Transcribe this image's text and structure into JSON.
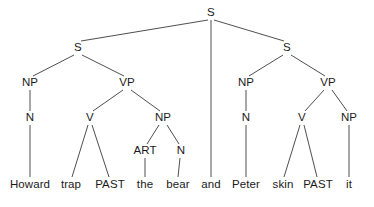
{
  "figure": {
    "type": "syntax-tree",
    "width": 374,
    "height": 207,
    "background_color": "#ffffff",
    "line_color": "#3a3a3a",
    "text_color": "#1a1a1a",
    "sentence": "Howard trap PAST the bear and Peter skin PAST it"
  },
  "nodes": {
    "root_s": {
      "label": "S",
      "x": 211,
      "y": 13
    },
    "left_s": {
      "label": "S",
      "x": 78,
      "y": 48
    },
    "right_s": {
      "label": "S",
      "x": 287,
      "y": 48
    },
    "left_np": {
      "label": "NP",
      "x": 30,
      "y": 83
    },
    "left_vp": {
      "label": "VP",
      "x": 127,
      "y": 83
    },
    "right_np": {
      "label": "NP",
      "x": 246,
      "y": 83
    },
    "right_vp": {
      "label": "VP",
      "x": 328,
      "y": 83
    },
    "left_n": {
      "label": "N",
      "x": 30,
      "y": 118
    },
    "left_v": {
      "label": "V",
      "x": 90,
      "y": 118
    },
    "left_obj_np": {
      "label": "NP",
      "x": 163,
      "y": 118
    },
    "right_n": {
      "label": "N",
      "x": 246,
      "y": 118
    },
    "right_v": {
      "label": "V",
      "x": 302,
      "y": 118
    },
    "right_obj_np": {
      "label": "NP",
      "x": 349,
      "y": 118
    },
    "art": {
      "label": "ART",
      "x": 145,
      "y": 151
    },
    "obj_n": {
      "label": "N",
      "x": 181,
      "y": 151
    }
  },
  "leaves": [
    {
      "id": "leaf-howard",
      "label": "Howard",
      "x": 30,
      "y": 185
    },
    {
      "id": "leaf-trap",
      "label": "trap",
      "x": 71,
      "y": 185
    },
    {
      "id": "leaf-past-1",
      "label": "PAST",
      "x": 110,
      "y": 185
    },
    {
      "id": "leaf-the",
      "label": "the",
      "x": 145,
      "y": 185
    },
    {
      "id": "leaf-bear",
      "label": "bear",
      "x": 178,
      "y": 185
    },
    {
      "id": "leaf-and",
      "label": "and",
      "x": 211,
      "y": 185
    },
    {
      "id": "leaf-peter",
      "label": "Peter",
      "x": 246,
      "y": 185
    },
    {
      "id": "leaf-skin",
      "label": "skin",
      "x": 283,
      "y": 185
    },
    {
      "id": "leaf-past-2",
      "label": "PAST",
      "x": 318,
      "y": 185
    },
    {
      "id": "leaf-it",
      "label": "it",
      "x": 349,
      "y": 185
    }
  ],
  "edges": [
    {
      "from": "root_s",
      "to": "left_s",
      "x1": 208,
      "y1": 20,
      "x2": 81,
      "y2": 41
    },
    {
      "from": "root_s",
      "to": "leaf-and",
      "x1": 211,
      "y1": 20,
      "x2": 211,
      "y2": 177
    },
    {
      "from": "root_s",
      "to": "right_s",
      "x1": 214,
      "y1": 20,
      "x2": 284,
      "y2": 41
    },
    {
      "from": "left_s",
      "to": "left_np",
      "x1": 74,
      "y1": 55,
      "x2": 33,
      "y2": 76
    },
    {
      "from": "left_s",
      "to": "left_vp",
      "x1": 82,
      "y1": 55,
      "x2": 124,
      "y2": 76
    },
    {
      "from": "left_np",
      "to": "left_n",
      "x1": 30,
      "y1": 90,
      "x2": 30,
      "y2": 111
    },
    {
      "from": "left_vp",
      "to": "left_v",
      "x1": 123,
      "y1": 90,
      "x2": 93,
      "y2": 111
    },
    {
      "from": "left_vp",
      "to": "left_obj_np",
      "x1": 131,
      "y1": 90,
      "x2": 160,
      "y2": 111
    },
    {
      "from": "left_n",
      "to": "leaf-howard",
      "x1": 30,
      "y1": 125,
      "x2": 30,
      "y2": 177
    },
    {
      "from": "left_v",
      "to": "leaf-trap",
      "x1": 88,
      "y1": 125,
      "x2": 72,
      "y2": 177
    },
    {
      "from": "left_v",
      "to": "leaf-past-1",
      "x1": 92,
      "y1": 125,
      "x2": 109,
      "y2": 177
    },
    {
      "from": "left_obj_np",
      "to": "art",
      "x1": 159,
      "y1": 125,
      "x2": 147,
      "y2": 144
    },
    {
      "from": "left_obj_np",
      "to": "obj_n",
      "x1": 167,
      "y1": 125,
      "x2": 179,
      "y2": 144
    },
    {
      "from": "art",
      "to": "leaf-the",
      "x1": 145,
      "y1": 158,
      "x2": 145,
      "y2": 177
    },
    {
      "from": "obj_n",
      "to": "leaf-bear",
      "x1": 180,
      "y1": 158,
      "x2": 178,
      "y2": 177
    },
    {
      "from": "right_s",
      "to": "right_np",
      "x1": 283,
      "y1": 55,
      "x2": 249,
      "y2": 76
    },
    {
      "from": "right_s",
      "to": "right_vp",
      "x1": 291,
      "y1": 55,
      "x2": 325,
      "y2": 76
    },
    {
      "from": "right_np",
      "to": "right_n",
      "x1": 246,
      "y1": 90,
      "x2": 246,
      "y2": 111
    },
    {
      "from": "right_vp",
      "to": "right_v",
      "x1": 324,
      "y1": 90,
      "x2": 305,
      "y2": 111
    },
    {
      "from": "right_vp",
      "to": "right_obj_np",
      "x1": 332,
      "y1": 90,
      "x2": 347,
      "y2": 111
    },
    {
      "from": "right_n",
      "to": "leaf-peter",
      "x1": 246,
      "y1": 125,
      "x2": 246,
      "y2": 177
    },
    {
      "from": "right_v",
      "to": "leaf-skin",
      "x1": 300,
      "y1": 125,
      "x2": 284,
      "y2": 177
    },
    {
      "from": "right_v",
      "to": "leaf-past-2",
      "x1": 304,
      "y1": 125,
      "x2": 317,
      "y2": 177
    },
    {
      "from": "right_obj_np",
      "to": "leaf-it",
      "x1": 349,
      "y1": 125,
      "x2": 349,
      "y2": 177
    }
  ]
}
